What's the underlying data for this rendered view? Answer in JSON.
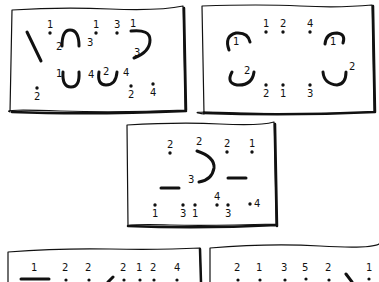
{
  "figure": {
    "panels": [
      {
        "id": "panel-1",
        "dots": [
          {
            "x": 50,
            "y": 33,
            "label": "1"
          },
          {
            "x": 96,
            "y": 33,
            "label": "1"
          },
          {
            "x": 117,
            "y": 33,
            "label": "3"
          },
          {
            "x": 37,
            "y": 88,
            "label": "2"
          },
          {
            "x": 131,
            "y": 86,
            "label": "2"
          },
          {
            "x": 153,
            "y": 84,
            "label": "4"
          }
        ],
        "stroke_labels": [
          {
            "x": 56,
            "y": 50,
            "label": "2"
          },
          {
            "x": 87,
            "y": 46,
            "label": "3"
          },
          {
            "x": 130,
            "y": 27,
            "label": "1"
          },
          {
            "x": 134,
            "y": 56,
            "label": "3"
          },
          {
            "x": 56,
            "y": 77,
            "label": "1"
          },
          {
            "x": 88,
            "y": 78,
            "label": "4"
          },
          {
            "x": 103,
            "y": 75,
            "label": "2"
          },
          {
            "x": 123,
            "y": 76,
            "label": "4"
          }
        ]
      },
      {
        "id": "panel-2",
        "dots": [
          {
            "x": 266,
            "y": 32,
            "label": "1"
          },
          {
            "x": 283,
            "y": 32,
            "label": "2"
          },
          {
            "x": 310,
            "y": 32,
            "label": "4"
          },
          {
            "x": 266,
            "y": 85,
            "label": "2"
          },
          {
            "x": 283,
            "y": 85,
            "label": "1"
          },
          {
            "x": 310,
            "y": 85,
            "label": "3"
          }
        ],
        "stroke_labels": [
          {
            "x": 233,
            "y": 45,
            "label": "1"
          },
          {
            "x": 330,
            "y": 45,
            "label": "1"
          },
          {
            "x": 244,
            "y": 74,
            "label": "2"
          },
          {
            "x": 349,
            "y": 70,
            "label": "2"
          }
        ]
      },
      {
        "id": "panel-3",
        "dots": [
          {
            "x": 170,
            "y": 153,
            "label": "2"
          },
          {
            "x": 227,
            "y": 152,
            "label": "2"
          },
          {
            "x": 252,
            "y": 152,
            "label": "1"
          },
          {
            "x": 155,
            "y": 205,
            "label": "1"
          },
          {
            "x": 183,
            "y": 205,
            "label": "3"
          },
          {
            "x": 195,
            "y": 205,
            "label": "1"
          },
          {
            "x": 217,
            "y": 205,
            "label": "4"
          },
          {
            "x": 228,
            "y": 205,
            "label": "3"
          },
          {
            "x": 250,
            "y": 204,
            "label": "4"
          }
        ],
        "stroke_labels": [
          {
            "x": 196,
            "y": 145,
            "label": "2"
          },
          {
            "x": 188,
            "y": 183,
            "label": "3"
          }
        ]
      },
      {
        "id": "panel-4",
        "labels": [
          "1",
          "2",
          "2",
          "2",
          "1",
          "2",
          "4"
        ]
      },
      {
        "id": "panel-5",
        "labels": [
          "2",
          "1",
          "3",
          "5",
          "2",
          "1"
        ]
      }
    ]
  }
}
